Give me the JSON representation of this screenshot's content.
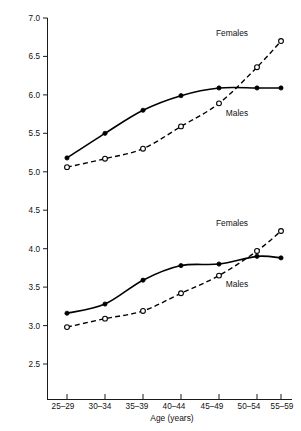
{
  "chart_data": {
    "type": "line",
    "title": "",
    "xlabel": "Age (years)",
    "ylabel": "",
    "categories": [
      "25–29",
      "30–34",
      "35–39",
      "40–44",
      "45–49",
      "50–54",
      "55–59"
    ],
    "ylim": [
      2.5,
      7.0
    ],
    "ytick_labels": [
      "2.5",
      "3.0",
      "3.5",
      "4.0",
      "4.5",
      "5.0",
      "5.5",
      "6.0",
      "6.5",
      "7.0"
    ],
    "ytick_values": [
      2.5,
      3.0,
      3.5,
      4.0,
      4.5,
      5.0,
      5.5,
      6.0,
      6.5,
      7.0
    ],
    "grid": false,
    "legend_position": "inline-annotations",
    "groups": [
      {
        "name": "upper",
        "series": [
          {
            "name": "Males",
            "style": "solid-filled-circles",
            "values": [
              5.18,
              5.5,
              5.8,
              5.99,
              6.09,
              6.09,
              6.09
            ]
          },
          {
            "name": "Females",
            "style": "dashed-open-circles",
            "values": [
              5.06,
              5.17,
              5.3,
              5.59,
              5.89,
              6.36,
              6.7
            ]
          }
        ],
        "annotations": [
          {
            "text": "Females",
            "x_category": "50–54",
            "y": 6.85
          },
          {
            "text": "Males",
            "x_category": "50–54",
            "y": 5.97
          }
        ]
      },
      {
        "name": "lower",
        "series": [
          {
            "name": "Males",
            "style": "solid-filled-circles",
            "values": [
              3.16,
              3.28,
              3.59,
              3.78,
              3.8,
              3.9,
              3.88
            ]
          },
          {
            "name": "Females",
            "style": "dashed-open-circles",
            "values": [
              2.98,
              3.09,
              3.19,
              3.42,
              3.65,
              3.97,
              4.23
            ]
          }
        ],
        "annotations": [
          {
            "text": "Females",
            "x_category": "50–54",
            "y": 4.42
          },
          {
            "text": "Males",
            "x_category": "50–54",
            "y": 3.7
          }
        ]
      }
    ]
  },
  "axis": {
    "x_title": "Age (years)",
    "x_tick_labels": [
      "25–29",
      "30–34",
      "35–39",
      "40–44",
      "45–49",
      "50–54",
      "55–59"
    ],
    "y_tick_labels": [
      "7.0",
      "6.5",
      "6.0",
      "5.5",
      "5.0",
      "4.5",
      "4.0",
      "3.5",
      "3.0",
      "2.5"
    ]
  },
  "annotations": {
    "upper_females": "Females",
    "upper_males": "Males",
    "lower_females": "Females",
    "lower_males": "Males"
  }
}
